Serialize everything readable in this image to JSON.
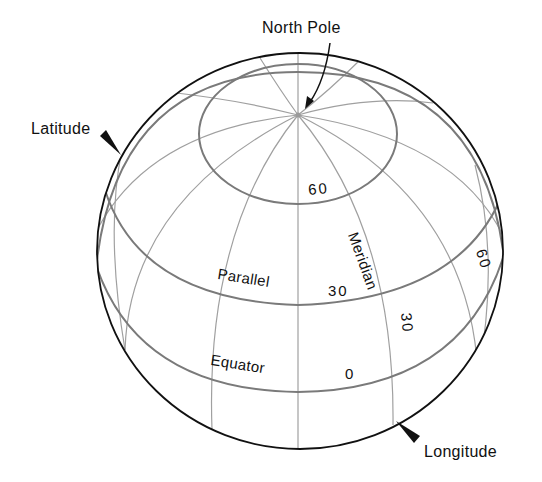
{
  "diagram": {
    "type": "globe graticule",
    "labels": {
      "north_pole": "North Pole",
      "latitude": "Latitude",
      "longitude": "Longitude",
      "meridian": "Meridian",
      "parallel": "Parallel",
      "equator": "Equator"
    },
    "parallel_values": {
      "p60": "60",
      "p30": "30",
      "p0": "0"
    },
    "meridian_values": {
      "m30": "30",
      "m60": "60"
    },
    "colors": {
      "rim": "#111111",
      "grid": "#8a8a8a",
      "text": "#111111",
      "background": "#ffffff"
    }
  }
}
